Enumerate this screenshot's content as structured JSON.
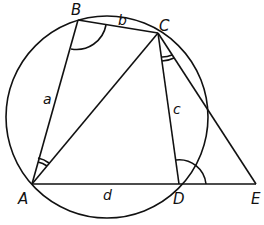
{
  "diagram": {
    "points": {
      "A": {
        "label": "A",
        "x": 32,
        "y": 184
      },
      "B": {
        "label": "B",
        "x": 78,
        "y": 20
      },
      "C": {
        "label": "C",
        "x": 158,
        "y": 33
      },
      "D": {
        "label": "D",
        "x": 179,
        "y": 184
      },
      "E": {
        "label": "E",
        "x": 256,
        "y": 184
      }
    },
    "sides": {
      "a": "a",
      "b": "b",
      "c": "c",
      "d": "d"
    },
    "circle": {
      "cx": 107,
      "cy": 117,
      "r": 101
    },
    "stroke_color": "#111111"
  }
}
